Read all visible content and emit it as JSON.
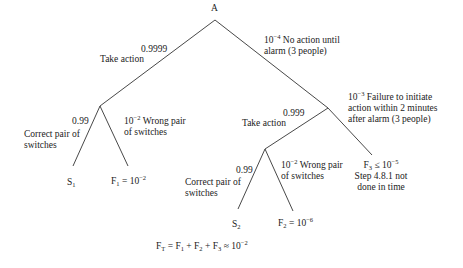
{
  "tree": {
    "root": {
      "label": "A"
    },
    "branch_take_action_1": {
      "prob": "0.9999",
      "label": "Take action"
    },
    "branch_no_action": {
      "prob_base": "10",
      "prob_exp": "−4",
      "text_line1": " No action until",
      "text_line2": "alarm (3 people)"
    },
    "branch_correct_1": {
      "prob": "0.99",
      "line1": "Correct pair of",
      "line2": "switches"
    },
    "branch_wrong_1": {
      "prob_base": "10",
      "prob_exp": "−2",
      "line1": " Wrong pair",
      "line2": "of switches"
    },
    "outcome_s1": {
      "base": "S",
      "sub": "1"
    },
    "outcome_f1": {
      "base": "F",
      "sub": "1",
      "eq": " = 10",
      "exp": "−2"
    },
    "branch_take_action_2": {
      "prob": "0.999",
      "label": "Take action"
    },
    "branch_failure_initiate": {
      "prob_base": "10",
      "prob_exp": "−3",
      "line1": " Failure to initiate",
      "line2": "action within 2 minutes",
      "line3": "after alarm (3 people)"
    },
    "branch_correct_2": {
      "prob": "0.99",
      "line1": "Correct pair of",
      "line2": "switches"
    },
    "branch_wrong_2": {
      "prob_base": "10",
      "prob_exp": "−2",
      "line1": " Wrong pair",
      "line2": "of switches"
    },
    "outcome_s2": {
      "base": "S",
      "sub": "2"
    },
    "outcome_f2": {
      "base": "F",
      "sub": "2",
      "eq": " = 10",
      "exp": "−6"
    },
    "outcome_f3": {
      "base": "F",
      "sub": "3",
      "eq": " ≤ 10",
      "exp": "−5",
      "line2": "Step 4.8.1 not",
      "line3": "done in time"
    },
    "total": {
      "ft_base": "F",
      "ft_sub": "T",
      "eq1": " = F",
      "s1": "1",
      "eq2": " + F",
      "s2": "2",
      "eq3": " + F",
      "s3": "3",
      "eq4": " ≈ 10",
      "exp": "−2"
    }
  },
  "colors": {
    "line": "#333333",
    "text": "#222222",
    "background": "#ffffff"
  }
}
